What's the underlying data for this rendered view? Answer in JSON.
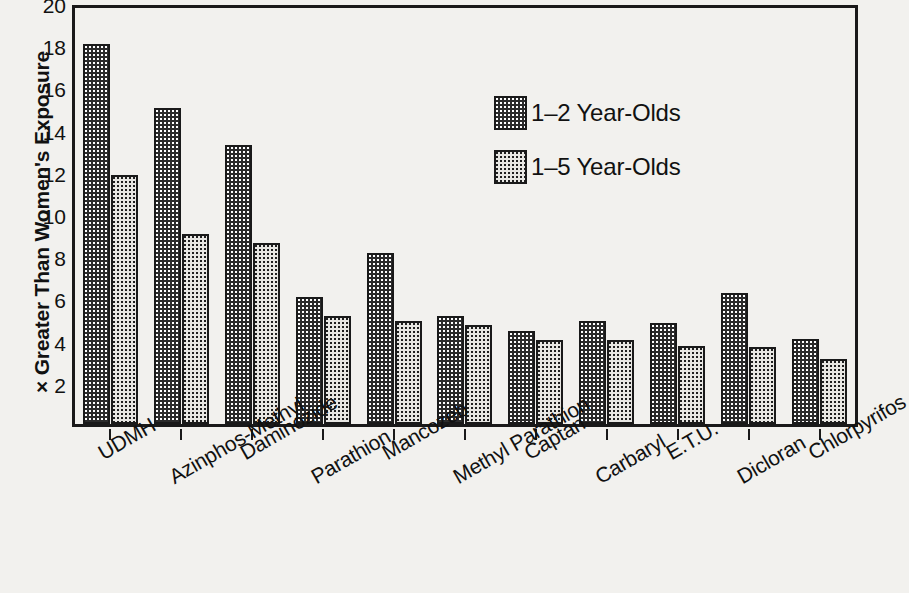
{
  "chart_data": {
    "type": "bar",
    "title": "",
    "xlabel": "",
    "ylabel": "× Greater Than Women's Exposure",
    "ylim": [
      0,
      20
    ],
    "ytick_step": 2,
    "yticks": [
      20,
      18,
      16,
      14,
      12,
      10,
      8,
      6,
      4,
      2
    ],
    "grid": false,
    "legend_position": "upper-right-inside",
    "categories": [
      "UDMH",
      "Azinphos-Methyl",
      "Daminozide",
      "Parathion",
      "Mancozeb",
      "Methyl Parathion",
      "Captan",
      "Carbaryl",
      "E.T.U.",
      "Dicloran",
      "Chlorpyrifos"
    ],
    "series": [
      {
        "name": "1–2 Year-Olds",
        "fill": "dark-dotted",
        "color": "#2b2b2b",
        "values": [
          18.0,
          15.0,
          13.2,
          6.0,
          8.1,
          5.1,
          4.4,
          4.9,
          4.8,
          6.2,
          4.05
        ]
      },
      {
        "name": "1–5 Year-Olds",
        "fill": "light-dotted",
        "color": "#e8e7e3",
        "values": [
          11.8,
          9.0,
          8.6,
          5.1,
          4.9,
          4.7,
          4.0,
          4.0,
          3.7,
          3.65,
          3.1
        ]
      }
    ]
  },
  "legend": {
    "items": [
      {
        "label": "1–2 Year-Olds",
        "swatch": "dark-dotted-swatch"
      },
      {
        "label": "1–5 Year-Olds",
        "swatch": "light-dotted-swatch"
      }
    ]
  },
  "colors": {
    "background": "#f2f1ee",
    "axis": "#1a1a1a",
    "series_dark": "#2b2b2b",
    "series_light": "#e8e7e3",
    "text": "#111111"
  }
}
